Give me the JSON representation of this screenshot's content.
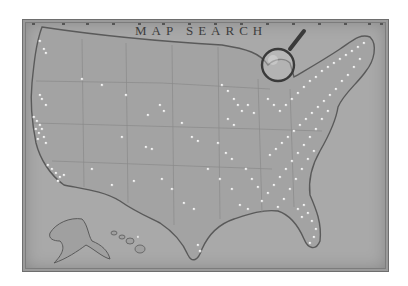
{
  "title": "MAP SEARCH",
  "map": {
    "subject": "United States map with location pins",
    "regions": [
      "contiguous-us",
      "alaska",
      "hawaii"
    ],
    "background_color": "#a9a9a9",
    "land_color": "#a3a3a3",
    "border_color": "#5a5a5a",
    "pin_color": "#f2f2f2",
    "pin_density": {
      "west_coast": "high",
      "mountain_west": "low",
      "plains": "low",
      "midwest": "medium",
      "east": "very high",
      "florida": "high",
      "alaska": "none",
      "hawaii": "low"
    }
  },
  "decoration": {
    "magnifier_icon": "magnifying-glass",
    "top_ruler_ticks": 15
  }
}
